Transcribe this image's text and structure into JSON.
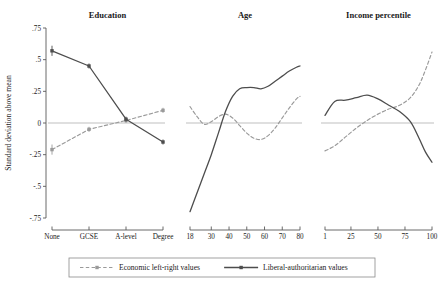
{
  "figure": {
    "ylabel": "Standard deviation above mean",
    "y_ticks": [
      ".75",
      ".5",
      ".25",
      "0",
      "-.25",
      "-.5",
      "-.75"
    ],
    "y_tick_values": [
      0.75,
      0.5,
      0.25,
      0,
      -0.25,
      -0.5,
      -0.75
    ],
    "ylim": [
      -0.75,
      0.75
    ],
    "zero_line": true,
    "grid": false,
    "legend_position": "bottom-center",
    "colors": {
      "economic_series": "#9a9a9a",
      "liberal_series": "#4d4d4d",
      "zero_line": "#d4d4d4",
      "axis": "#5a5a5a",
      "text": "#1a1a1a"
    }
  },
  "legend": {
    "items": [
      {
        "label": "Economic left-right values",
        "style": "dashed",
        "marker": "square",
        "color": "#9a9a9a"
      },
      {
        "label": "Liberal-authoritarian values",
        "style": "solid",
        "marker": "square",
        "color": "#4d4d4d"
      }
    ]
  },
  "chart_data": [
    {
      "type": "line",
      "title": "Education",
      "xlabel": "",
      "ylabel": "Standard deviation above mean",
      "ylim": [
        -0.75,
        0.75
      ],
      "categories": [
        "None",
        "GCSE",
        "A-level",
        "Degree"
      ],
      "x_tick_labels": [
        "None",
        "GCSE",
        "A-level",
        "Degree"
      ],
      "markers": true,
      "error_bars": true,
      "series": [
        {
          "name": "Economic left-right values",
          "style": "dashed",
          "color": "#9a9a9a",
          "values": [
            -0.21,
            -0.05,
            0.02,
            0.1
          ],
          "errors": [
            0.04,
            0.02,
            0.02,
            0.02
          ]
        },
        {
          "name": "Liberal-authoritarian values",
          "style": "solid",
          "color": "#4d4d4d",
          "values": [
            0.57,
            0.45,
            0.03,
            -0.15
          ],
          "errors": [
            0.04,
            0.02,
            0.02,
            0.02
          ]
        }
      ]
    },
    {
      "type": "line",
      "title": "Age",
      "xlabel": "",
      "ylabel": "",
      "ylim": [
        -0.75,
        0.75
      ],
      "xlim": [
        18,
        80
      ],
      "x_tick_labels": [
        "18",
        "30",
        "40",
        "50",
        "60",
        "70",
        "80"
      ],
      "x_tick_values": [
        18,
        30,
        40,
        50,
        60,
        70,
        80
      ],
      "markers": false,
      "series": [
        {
          "name": "Economic left-right values",
          "style": "dashed",
          "color": "#9a9a9a",
          "x": [
            18,
            22,
            26,
            30,
            34,
            38,
            42,
            46,
            50,
            54,
            58,
            62,
            66,
            70,
            74,
            78,
            80
          ],
          "values": [
            0.13,
            0.05,
            -0.01,
            0.01,
            0.05,
            0.07,
            0.04,
            -0.02,
            -0.08,
            -0.12,
            -0.13,
            -0.1,
            -0.04,
            0.04,
            0.12,
            0.19,
            0.21
          ]
        },
        {
          "name": "Liberal-authoritarian values",
          "style": "solid",
          "color": "#4d4d4d",
          "x": [
            18,
            22,
            26,
            30,
            34,
            38,
            42,
            46,
            50,
            54,
            58,
            62,
            66,
            70,
            74,
            78,
            80
          ],
          "values": [
            -0.7,
            -0.55,
            -0.4,
            -0.25,
            -0.08,
            0.09,
            0.21,
            0.27,
            0.28,
            0.28,
            0.27,
            0.29,
            0.33,
            0.37,
            0.41,
            0.44,
            0.45
          ]
        }
      ]
    },
    {
      "type": "line",
      "title": "Income percentile",
      "xlabel": "",
      "ylabel": "",
      "ylim": [
        -0.75,
        0.75
      ],
      "xlim": [
        1,
        100
      ],
      "x_tick_labels": [
        "1",
        "25",
        "50",
        "75",
        "100"
      ],
      "x_tick_values": [
        1,
        25,
        50,
        75,
        100
      ],
      "markers": false,
      "series": [
        {
          "name": "Economic left-right values",
          "style": "dashed",
          "color": "#9a9a9a",
          "x": [
            1,
            10,
            20,
            30,
            40,
            50,
            60,
            70,
            80,
            88,
            94,
            100
          ],
          "values": [
            -0.22,
            -0.18,
            -0.11,
            -0.04,
            0.02,
            0.07,
            0.11,
            0.14,
            0.2,
            0.3,
            0.42,
            0.56
          ]
        },
        {
          "name": "Liberal-authoritarian values",
          "style": "solid",
          "color": "#4d4d4d",
          "x": [
            1,
            10,
            20,
            30,
            40,
            50,
            60,
            70,
            80,
            88,
            94,
            100
          ],
          "values": [
            0.06,
            0.17,
            0.18,
            0.2,
            0.22,
            0.19,
            0.14,
            0.09,
            0.01,
            -0.12,
            -0.23,
            -0.31
          ]
        }
      ]
    }
  ]
}
